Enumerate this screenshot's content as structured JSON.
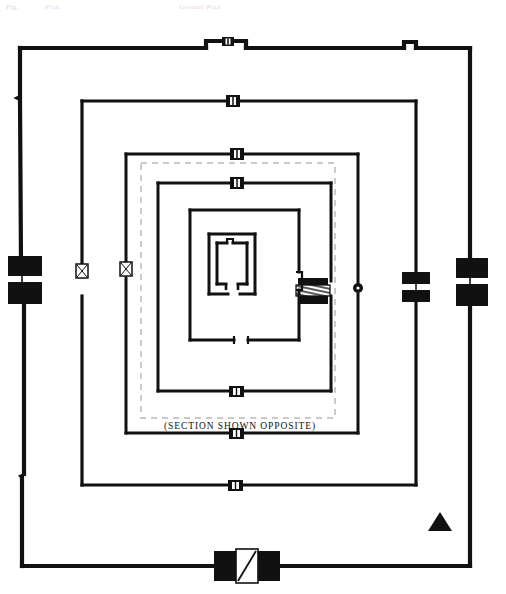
{
  "document": {
    "title": "Temple Ground Plan",
    "ghost_header": {
      "left": "Fig.",
      "middle": "Plan",
      "right": "Ground Plan"
    }
  },
  "plan": {
    "caption": "(SECTION SHOWN OPPOSITE)",
    "colors": {
      "wall": "#111111",
      "background": "#ffffff",
      "section_dash": "#b9b9bd",
      "gate_fill": "#111111",
      "gate_open": "#ffffff"
    },
    "north_arrow": {
      "label": "north-indicator",
      "shape": "triangle",
      "x": 440,
      "y": 523
    },
    "enclosures": [
      {
        "name": "outer-enclosure-wall",
        "index": 1,
        "x": 18,
        "y": 45,
        "width": 454,
        "height": 522,
        "stroke_width": 4.2
      },
      {
        "name": "second-enclosure-wall",
        "index": 2,
        "x": 80,
        "y": 99,
        "width": 338,
        "height": 388,
        "stroke_width": 3.2
      },
      {
        "name": "third-enclosure-wall",
        "index": 3,
        "x": 124,
        "y": 152,
        "width": 236,
        "height": 283,
        "stroke_width": 3.0
      },
      {
        "name": "fourth-enclosure-wall",
        "index": 4,
        "x": 156,
        "y": 181,
        "width": 177,
        "height": 212,
        "stroke_width": 3.0
      },
      {
        "name": "fifth-enclosure-wall",
        "index": 5,
        "x": 188,
        "y": 208,
        "width": 113,
        "height": 134,
        "stroke_width": 3.0
      }
    ],
    "section_marker": {
      "name": "section-cut-outline",
      "x": 141,
      "y": 163,
      "width": 194,
      "height": 255,
      "style": "dashed"
    },
    "sanctum": {
      "name": "central-sanctum",
      "outer": {
        "x": 208,
        "y": 233,
        "width": 48,
        "height": 62
      },
      "inner": {
        "x": 216,
        "y": 241,
        "width": 32,
        "height": 44
      }
    },
    "gateways": [
      {
        "name": "gopuram-west-outer",
        "type": "major-block",
        "x": 18,
        "y": 275,
        "orientation": "vertical"
      },
      {
        "name": "gopuram-east-outer",
        "type": "major-block",
        "x": 472,
        "y": 277,
        "orientation": "vertical"
      },
      {
        "name": "gopuram-south-outer",
        "type": "major-open",
        "x": 235,
        "y": 567,
        "orientation": "horizontal"
      },
      {
        "name": "gopuram-north-outer",
        "type": "notch-small",
        "x": 222,
        "y": 45,
        "orientation": "horizontal"
      },
      {
        "name": "gate-east-second",
        "type": "major-block",
        "x": 412,
        "y": 284,
        "orientation": "vertical"
      },
      {
        "name": "gate-north-second",
        "type": "small",
        "x": 232,
        "y": 99,
        "orientation": "horizontal"
      },
      {
        "name": "gate-south-second",
        "type": "small",
        "x": 232,
        "y": 487,
        "orientation": "horizontal"
      },
      {
        "name": "gate-west-second",
        "type": "small-x",
        "x": 80,
        "y": 270,
        "orientation": "vertical"
      },
      {
        "name": "gate-east-third",
        "type": "dot",
        "x": 360,
        "y": 288,
        "orientation": "vertical"
      },
      {
        "name": "gate-north-third",
        "type": "small",
        "x": 236,
        "y": 152,
        "orientation": "horizontal"
      },
      {
        "name": "gate-south-third",
        "type": "small",
        "x": 236,
        "y": 435,
        "orientation": "horizontal"
      },
      {
        "name": "gate-west-third",
        "type": "small-x",
        "x": 124,
        "y": 270,
        "orientation": "vertical"
      },
      {
        "name": "gate-north-fourth",
        "type": "small",
        "x": 236,
        "y": 181,
        "orientation": "horizontal"
      },
      {
        "name": "gate-south-fourth",
        "type": "small",
        "x": 236,
        "y": 342,
        "orientation": "horizontal"
      },
      {
        "name": "gate-east-fourth",
        "type": "hatched-block",
        "x": 308,
        "y": 288,
        "orientation": "vertical"
      },
      {
        "name": "gate-east-fifth",
        "type": "tick",
        "x": 301,
        "y": 281,
        "orientation": "vertical"
      }
    ]
  }
}
